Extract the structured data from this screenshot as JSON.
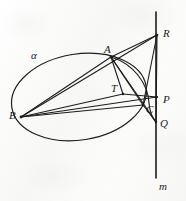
{
  "figure": {
    "background_color": "#fbfbfa",
    "ink_color": "#1c1c1c",
    "labels": [
      {
        "id": "alpha",
        "text": "α",
        "x": 31,
        "y": 50,
        "role": "curve-name-ellipse"
      },
      {
        "id": "A",
        "text": "A",
        "x": 104,
        "y": 44,
        "role": "point"
      },
      {
        "id": "B",
        "text": "B",
        "x": 9,
        "y": 110,
        "role": "point"
      },
      {
        "id": "C",
        "text": "C",
        "x": 146,
        "y": 104,
        "role": "point"
      },
      {
        "id": "T",
        "text": "T",
        "x": 111,
        "y": 83,
        "role": "point"
      },
      {
        "id": "P",
        "text": "P",
        "x": 163,
        "y": 94,
        "role": "point"
      },
      {
        "id": "Q",
        "text": "Q",
        "x": 160,
        "y": 118,
        "role": "point"
      },
      {
        "id": "R",
        "text": "R",
        "x": 163,
        "y": 28,
        "role": "point"
      },
      {
        "id": "m",
        "text": "m",
        "x": 159,
        "y": 181,
        "role": "line-name"
      }
    ],
    "points": {
      "A": {
        "x": 111,
        "y": 57
      },
      "B": {
        "x": 21,
        "y": 117
      },
      "C": {
        "x": 143,
        "y": 105
      },
      "T": {
        "x": 123,
        "y": 94
      },
      "P": {
        "x": 157,
        "y": 97
      },
      "Q": {
        "x": 156,
        "y": 122
      },
      "R": {
        "x": 157,
        "y": 35
      }
    },
    "ellipse": {
      "name": "α",
      "center_x": 79,
      "center_y": 97,
      "radius_x": 68,
      "radius_y": 43,
      "rotation_deg": -9
    },
    "arc": {
      "name": "conic-arc-through-A-C",
      "from": "A",
      "to": "Q"
    },
    "line_m": {
      "name": "m",
      "x": 156,
      "y_top": 12,
      "y_bottom": 178
    },
    "segments": [
      {
        "from": "A",
        "to": "B"
      },
      {
        "from": "A",
        "to": "R"
      },
      {
        "from": "A",
        "to": "T"
      },
      {
        "from": "A",
        "to": "C"
      },
      {
        "from": "A",
        "to": "Q"
      },
      {
        "from": "B",
        "to": "R"
      },
      {
        "from": "B",
        "to": "P"
      },
      {
        "from": "B",
        "to": "C"
      },
      {
        "from": "B",
        "to": "T"
      },
      {
        "from": "R",
        "to": "C"
      },
      {
        "from": "R",
        "to": "Q"
      },
      {
        "from": "C",
        "to": "Q"
      },
      {
        "from": "T",
        "to": "P"
      }
    ]
  }
}
